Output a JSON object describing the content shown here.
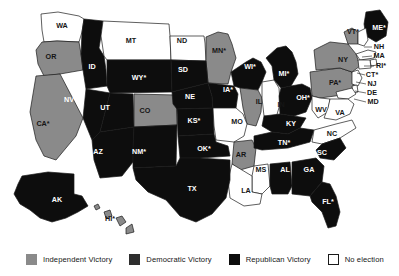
{
  "figure": {
    "background_color": "#ffffff"
  },
  "colors": {
    "independent": "#8a8a8a",
    "democratic": "#2e2e2e",
    "republican": "#0d0d0d",
    "no_election": "#ffffff",
    "border": "#1a1a1a",
    "label_light": "#ffffff",
    "label_dark": "#151515"
  },
  "legend": {
    "items": [
      {
        "key": "independent",
        "label": "Independent Victory",
        "swatch": "#8a8a8a",
        "border": "#8a8a8a"
      },
      {
        "key": "democratic",
        "label": "Democratic Victory",
        "swatch": "#2e2e2e",
        "border": "#2e2e2e"
      },
      {
        "key": "republican",
        "label": "Republican Victory",
        "swatch": "#0d0d0d",
        "border": "#0d0d0d"
      },
      {
        "key": "no_election",
        "label": "No election",
        "swatch": "#ffffff",
        "border": "#1a1a1a"
      }
    ]
  },
  "map": {
    "states": [
      {
        "code": "WA",
        "label": "WA",
        "result": "no_election",
        "label_x": 62,
        "label_y": 26
      },
      {
        "code": "OR",
        "label": "OR",
        "result": "independent",
        "label_x": 51,
        "label_y": 57
      },
      {
        "code": "ID",
        "label": "ID",
        "result": "republican",
        "label_x": 92,
        "label_y": 67
      },
      {
        "code": "MT",
        "label": "MT",
        "result": "no_election",
        "label_x": 131,
        "label_y": 41
      },
      {
        "code": "ND",
        "label": "ND",
        "result": "no_election",
        "label_x": 182,
        "label_y": 41
      },
      {
        "code": "MN",
        "label": "MN*",
        "result": "independent",
        "label_x": 219,
        "label_y": 51
      },
      {
        "code": "WY",
        "label": "WY*",
        "result": "republican",
        "label_x": 139,
        "label_y": 78
      },
      {
        "code": "SD",
        "label": "SD",
        "result": "republican",
        "label_x": 183,
        "label_y": 70
      },
      {
        "code": "WI",
        "label": "WI*",
        "result": "republican",
        "label_x": 250,
        "label_y": 67
      },
      {
        "code": "MI",
        "label": "MI*",
        "result": "republican",
        "label_x": 284,
        "label_y": 74
      },
      {
        "code": "NV",
        "label": "NV",
        "result": "republican",
        "label_x": 69,
        "label_y": 100
      },
      {
        "code": "UT",
        "label": "UT",
        "result": "republican",
        "label_x": 105,
        "label_y": 108
      },
      {
        "code": "CO",
        "label": "CO",
        "result": "independent",
        "label_x": 145,
        "label_y": 111
      },
      {
        "code": "NE",
        "label": "NE",
        "result": "republican",
        "label_x": 190,
        "label_y": 97
      },
      {
        "code": "IA",
        "label": "IA*",
        "result": "republican",
        "label_x": 228,
        "label_y": 90
      },
      {
        "code": "IL",
        "label": "IL",
        "result": "independent",
        "label_x": 259,
        "label_y": 102
      },
      {
        "code": "IN",
        "label": "IN",
        "result": "no_election",
        "label_x": 281,
        "label_y": 105
      },
      {
        "code": "OH",
        "label": "OH*",
        "result": "republican",
        "label_x": 303,
        "label_y": 98
      },
      {
        "code": "PA",
        "label": "PA*",
        "result": "independent",
        "label_x": 335,
        "label_y": 83
      },
      {
        "code": "NY",
        "label": "NY",
        "result": "independent",
        "label_x": 343,
        "label_y": 60
      },
      {
        "code": "VT",
        "label": "VT*",
        "result": "independent",
        "label_x": 353,
        "label_y": 32
      },
      {
        "code": "ME",
        "label": "ME*",
        "result": "republican",
        "label_x": 379,
        "label_y": 28
      },
      {
        "code": "NH",
        "label": "NH",
        "result": "no_election",
        "label_x": 379,
        "label_y": 47
      },
      {
        "code": "MA",
        "label": "MA",
        "result": "no_election",
        "label_x": 379,
        "label_y": 56
      },
      {
        "code": "RI",
        "label": "RI*",
        "result": "no_election",
        "label_x": 381,
        "label_y": 66
      },
      {
        "code": "CT",
        "label": "CT*",
        "result": "no_election",
        "label_x": 372,
        "label_y": 75
      },
      {
        "code": "NJ",
        "label": "NJ",
        "result": "no_election",
        "label_x": 372,
        "label_y": 84
      },
      {
        "code": "DE",
        "label": "DE",
        "result": "no_election",
        "label_x": 372,
        "label_y": 93
      },
      {
        "code": "MD",
        "label": "MD",
        "result": "no_election",
        "label_x": 373,
        "label_y": 102
      },
      {
        "code": "WV",
        "label": "WV",
        "result": "no_election",
        "label_x": 321,
        "label_y": 110
      },
      {
        "code": "VA",
        "label": "VA",
        "result": "no_election",
        "label_x": 340,
        "label_y": 113
      },
      {
        "code": "CA",
        "label": "CA*",
        "result": "independent",
        "label_x": 43,
        "label_y": 124
      },
      {
        "code": "AZ",
        "label": "AZ",
        "result": "republican",
        "label_x": 98,
        "label_y": 152
      },
      {
        "code": "NM",
        "label": "NM*",
        "result": "republican",
        "label_x": 139,
        "label_y": 152
      },
      {
        "code": "KS",
        "label": "KS*",
        "result": "republican",
        "label_x": 194,
        "label_y": 121
      },
      {
        "code": "MO",
        "label": "MO",
        "result": "no_election",
        "label_x": 237,
        "label_y": 122
      },
      {
        "code": "KY",
        "label": "KY",
        "result": "republican",
        "label_x": 291,
        "label_y": 124
      },
      {
        "code": "OK",
        "label": "OK*",
        "result": "republican",
        "label_x": 204,
        "label_y": 149
      },
      {
        "code": "AR",
        "label": "AR",
        "result": "independent",
        "label_x": 241,
        "label_y": 155
      },
      {
        "code": "TN",
        "label": "TN*",
        "result": "republican",
        "label_x": 284,
        "label_y": 143
      },
      {
        "code": "NC",
        "label": "NC",
        "result": "no_election",
        "label_x": 332,
        "label_y": 134
      },
      {
        "code": "SC",
        "label": "SC",
        "result": "republican",
        "label_x": 322,
        "label_y": 153
      },
      {
        "code": "MS",
        "label": "MS",
        "result": "no_election",
        "label_x": 261,
        "label_y": 170
      },
      {
        "code": "AL",
        "label": "AL",
        "result": "republican",
        "label_x": 285,
        "label_y": 170
      },
      {
        "code": "GA",
        "label": "GA",
        "result": "republican",
        "label_x": 309,
        "label_y": 170
      },
      {
        "code": "LA",
        "label": "LA",
        "result": "no_election",
        "label_x": 246,
        "label_y": 191
      },
      {
        "code": "TX",
        "label": "TX",
        "result": "republican",
        "label_x": 192,
        "label_y": 189
      },
      {
        "code": "FL",
        "label": "FL*",
        "result": "republican",
        "label_x": 328,
        "label_y": 202
      },
      {
        "code": "AK",
        "label": "AK",
        "result": "republican",
        "label_x": 57,
        "label_y": 200
      },
      {
        "code": "HI",
        "label": "HI*",
        "result": "independent",
        "label_x": 110,
        "label_y": 219
      }
    ]
  }
}
